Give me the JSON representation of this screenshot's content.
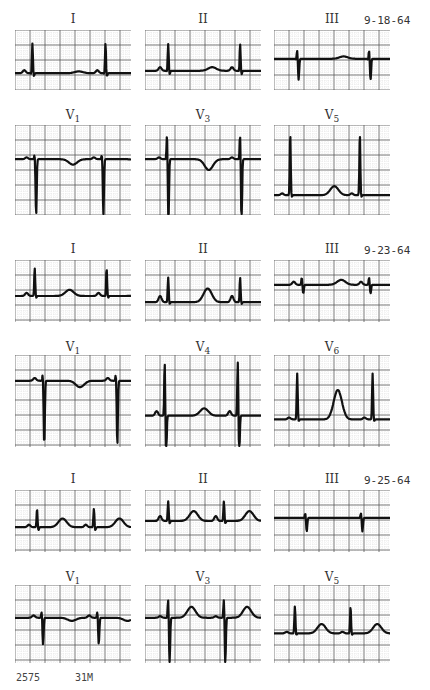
{
  "figure": {
    "recordings": [
      {
        "date": "9-18-64",
        "limb_leads": [
          {
            "lead": "I",
            "shape": "upright-r"
          },
          {
            "lead": "II",
            "shape": "upright-r-small"
          },
          {
            "lead": "III",
            "shape": "qs-neg"
          }
        ],
        "chest_leads": [
          {
            "lead": "V",
            "sub": "1",
            "shape": "rs-deep-v1"
          },
          {
            "lead": "V",
            "sub": "3",
            "shape": "rs-deep-inverted-t"
          },
          {
            "lead": "V",
            "sub": "5",
            "shape": "tall-r"
          }
        ]
      },
      {
        "date": "9-23-64",
        "limb_leads": [
          {
            "lead": "I",
            "shape": "upright-r-t"
          },
          {
            "lead": "II",
            "shape": "upright-r-bigt"
          },
          {
            "lead": "III",
            "shape": "flat-small"
          }
        ],
        "chest_leads": [
          {
            "lead": "V",
            "sub": "1",
            "shape": "rs-deep-v1-inv"
          },
          {
            "lead": "V",
            "sub": "4",
            "shape": "deep-big"
          },
          {
            "lead": "V",
            "sub": "6",
            "shape": "tall-r-bigt"
          }
        ]
      },
      {
        "date": "9-25-64",
        "limb_leads": [
          {
            "lead": "I",
            "shape": "fast-r-t"
          },
          {
            "lead": "II",
            "shape": "fast-r-t2"
          },
          {
            "lead": "III",
            "shape": "qs-small"
          }
        ],
        "chest_leads": [
          {
            "lead": "V",
            "sub": "1",
            "shape": "rs-v1-mod"
          },
          {
            "lead": "V",
            "sub": "3",
            "shape": "rs-v3-t"
          },
          {
            "lead": "V",
            "sub": "5",
            "shape": "r-t-v5"
          }
        ]
      }
    ],
    "footer": {
      "case_number": "2575",
      "patient": "31M"
    }
  }
}
